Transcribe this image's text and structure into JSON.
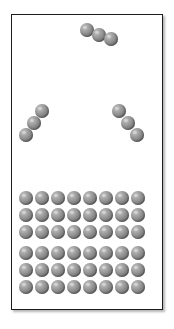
{
  "figure": {
    "title": "",
    "background_color": "#ffffff",
    "frame_color": "#1c1c1c",
    "atom_color": "#8f8f8f",
    "atom_highlight_color": "#c8c8c8",
    "atom_shadow_color": "#4e4e4e"
  },
  "container": {
    "x": 11,
    "y": 14,
    "width": 152,
    "height": 296
  },
  "atom_radius_px": 7,
  "gas_phase": {
    "label": "gas-phase-molecules",
    "molecule_count": 3,
    "atoms_per_molecule": 3,
    "molecules": [
      {
        "name": "molecule-top",
        "orientation": "diagonal-down-right",
        "atoms": [
          {
            "cx": 86,
            "cy": 29
          },
          {
            "cx": 98,
            "cy": 34
          },
          {
            "cx": 110,
            "cy": 38
          }
        ]
      },
      {
        "name": "molecule-left",
        "orientation": "diagonal-down-left",
        "atoms": [
          {
            "cx": 41,
            "cy": 110
          },
          {
            "cx": 33,
            "cy": 122
          },
          {
            "cx": 25,
            "cy": 134
          }
        ]
      },
      {
        "name": "molecule-right",
        "orientation": "diagonal-down-right",
        "atoms": [
          {
            "cx": 118,
            "cy": 110
          },
          {
            "cx": 127,
            "cy": 122
          },
          {
            "cx": 136,
            "cy": 134
          }
        ]
      }
    ]
  },
  "condensed_phase": {
    "label": "condensed-lattice",
    "block_count": 4,
    "block_columns": 4,
    "block_rows": 3,
    "atom_spacing_x": 16,
    "atom_spacing_y": 17,
    "total_atoms": 48,
    "blocks": [
      {
        "name": "lattice-block-top-left",
        "x": 25,
        "y": 197
      },
      {
        "name": "lattice-block-top-right",
        "x": 89,
        "y": 197
      },
      {
        "name": "lattice-block-bottom-left",
        "x": 25,
        "y": 252
      },
      {
        "name": "lattice-block-bottom-right",
        "x": 89,
        "y": 252
      }
    ]
  }
}
